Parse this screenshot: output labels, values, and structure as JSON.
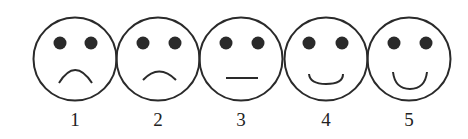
{
  "scale": {
    "type": "smiley-face rating scale",
    "faces": [
      {
        "label": "1",
        "expression": "very-sad",
        "mouth": "frown-deep"
      },
      {
        "label": "2",
        "expression": "sad",
        "mouth": "frown-slight"
      },
      {
        "label": "3",
        "expression": "neutral",
        "mouth": "flat"
      },
      {
        "label": "4",
        "expression": "happy",
        "mouth": "smile-slight"
      },
      {
        "label": "5",
        "expression": "very-happy",
        "mouth": "smile-deep"
      }
    ]
  },
  "colors": {
    "stroke": "#2a2a2a",
    "background": "#ffffff"
  }
}
